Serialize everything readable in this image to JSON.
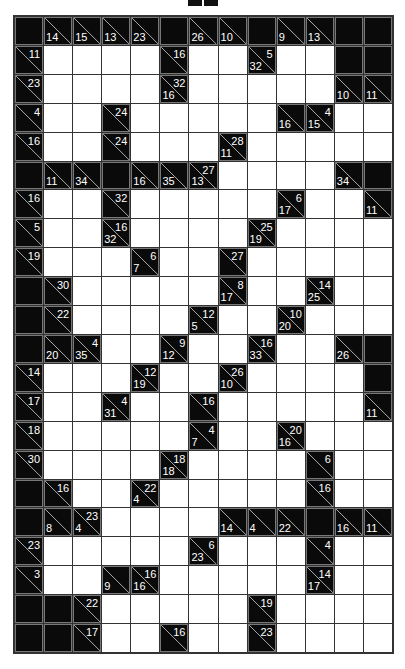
{
  "puzzle": {
    "type": "kakuro",
    "cols": 13,
    "rows": 22,
    "legend": "Each clue cell: 'd' = down sum (bottom-left), 'r' = across sum (top-right). 'B' = blocked, 'W' = empty white cell.",
    "grid": [
      [
        "B",
        {
          "d": 14
        },
        {
          "d": 15
        },
        {
          "d": 13
        },
        {
          "d": 23
        },
        "B",
        {
          "d": 26
        },
        {
          "d": 10
        },
        "B",
        {
          "d": 9
        },
        {
          "d": 13
        },
        "B",
        "B"
      ],
      [
        {
          "r": 11
        },
        "W",
        "W",
        "W",
        "W",
        {
          "r": 16
        },
        "W",
        "W",
        {
          "d": 32,
          "r": 5
        },
        "W",
        "W",
        "B",
        "B"
      ],
      [
        {
          "r": 23
        },
        "W",
        "W",
        "W",
        "W",
        {
          "d": 16,
          "r": 32
        },
        "W",
        "W",
        "W",
        "W",
        "W",
        {
          "d": 10
        },
        {
          "d": 11
        }
      ],
      [
        {
          "r": 4
        },
        "W",
        "W",
        {
          "r": 24
        },
        "W",
        "W",
        "W",
        "W",
        "W",
        {
          "d": 16
        },
        {
          "d": 15,
          "r": 4
        },
        "W",
        "W"
      ],
      [
        {
          "r": 16
        },
        "W",
        "W",
        {
          "r": 24
        },
        "W",
        "W",
        "W",
        {
          "d": 11,
          "r": 28
        },
        "W",
        "W",
        "W",
        "W",
        "W"
      ],
      [
        "B",
        {
          "d": 11
        },
        {
          "d": 34
        },
        "B",
        {
          "d": 16
        },
        {
          "d": 35
        },
        {
          "d": 13,
          "r": 27
        },
        "W",
        "W",
        "W",
        "W",
        {
          "d": 34
        },
        "B"
      ],
      [
        {
          "r": 16
        },
        "W",
        "W",
        {
          "r": 32
        },
        "W",
        "W",
        "W",
        "W",
        "W",
        {
          "d": 17,
          "r": 6
        },
        "W",
        "W",
        {
          "d": 11
        }
      ],
      [
        {
          "r": 5
        },
        "W",
        "W",
        {
          "d": 32,
          "r": 16
        },
        "W",
        "W",
        "W",
        "W",
        {
          "d": 19,
          "r": 25
        },
        "W",
        "W",
        "W",
        "W"
      ],
      [
        {
          "r": 19
        },
        "W",
        "W",
        "W",
        {
          "d": 7,
          "r": 6
        },
        "W",
        "W",
        {
          "r": 27
        },
        "W",
        "W",
        "W",
        "W",
        "W"
      ],
      [
        "B",
        {
          "r": 30
        },
        "W",
        "W",
        "W",
        "W",
        "W",
        {
          "d": 17,
          "r": 8
        },
        "W",
        "W",
        {
          "d": 25,
          "r": 14
        },
        "W",
        "W"
      ],
      [
        "B",
        {
          "r": 22
        },
        "W",
        "W",
        "W",
        "W",
        {
          "d": 5,
          "r": 12
        },
        "W",
        "W",
        {
          "d": 20,
          "r": 10
        },
        "W",
        "W",
        "W"
      ],
      [
        "B",
        {
          "d": 20
        },
        {
          "d": 35,
          "r": 4
        },
        "W",
        "W",
        {
          "d": 12,
          "r": 9
        },
        "W",
        "W",
        {
          "d": 33,
          "r": 16
        },
        "W",
        "W",
        {
          "d": 26
        },
        "B"
      ],
      [
        {
          "r": 14
        },
        "W",
        "W",
        "W",
        {
          "d": 19,
          "r": 12
        },
        "W",
        "W",
        {
          "d": 10,
          "r": 26
        },
        "W",
        "W",
        "W",
        "W",
        "B"
      ],
      [
        {
          "r": 17
        },
        "W",
        "W",
        {
          "d": 31,
          "r": 4
        },
        "W",
        "W",
        {
          "r": 16
        },
        "W",
        "W",
        "W",
        "W",
        "W",
        {
          "d": 11
        }
      ],
      [
        {
          "r": 18
        },
        "W",
        "W",
        "W",
        "W",
        "W",
        {
          "d": 7,
          "r": 4
        },
        "W",
        "W",
        {
          "d": 16,
          "r": 20
        },
        "W",
        "W",
        "W"
      ],
      [
        {
          "r": 30
        },
        "W",
        "W",
        "W",
        "W",
        {
          "d": 18,
          "r": 18
        },
        "W",
        "W",
        "W",
        "W",
        {
          "r": 6
        },
        "W",
        "W"
      ],
      [
        "B",
        {
          "r": 16
        },
        "W",
        "W",
        {
          "d": 4,
          "r": 22
        },
        "W",
        "W",
        "W",
        "W",
        "W",
        {
          "r": 16
        },
        "W",
        "W"
      ],
      [
        "B",
        {
          "d": 8
        },
        {
          "d": 4,
          "r": 23
        },
        "W",
        "W",
        "W",
        "W",
        {
          "d": 14
        },
        {
          "d": 4
        },
        {
          "d": 22
        },
        "B",
        {
          "d": 16
        },
        {
          "d": 11
        }
      ],
      [
        {
          "r": 23
        },
        "W",
        "W",
        "W",
        "W",
        "W",
        {
          "d": 23,
          "r": 6
        },
        "W",
        "W",
        "W",
        {
          "r": 4
        },
        "W",
        "W"
      ],
      [
        {
          "r": 3
        },
        "W",
        "W",
        {
          "d": 9
        },
        {
          "d": 16,
          "r": 16
        },
        "W",
        "W",
        "W",
        "W",
        "W",
        {
          "d": 17,
          "r": 14
        },
        "W",
        "W"
      ],
      [
        "B",
        "B",
        {
          "r": 22
        },
        "W",
        "W",
        "W",
        "W",
        "W",
        {
          "r": 19
        },
        "W",
        "W",
        "W",
        "W"
      ],
      [
        "B",
        "B",
        {
          "r": 17
        },
        "W",
        "W",
        {
          "r": 16
        },
        "W",
        "W",
        {
          "r": 23
        },
        "W",
        "W",
        "W",
        "W"
      ]
    ]
  },
  "colors": {
    "block": "#0a0a0a",
    "white_cell": "#ffffff",
    "grid_line": "#333333",
    "clue_text": "#ffffff",
    "diagonal": "#cccccc"
  },
  "top_indicator": {
    "icon": "double-bar-icon"
  }
}
